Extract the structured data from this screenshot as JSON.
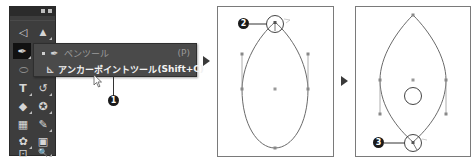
{
  "toolbar": {
    "tools": [
      {
        "name": "direct-selection-tool",
        "glyph": "◁"
      },
      {
        "name": "selection-tool",
        "glyph": "▲"
      },
      {
        "name": "pen-tool",
        "glyph": "✒",
        "active": true
      },
      {
        "name": "curvature-tool",
        "glyph": "·"
      },
      {
        "name": "ellipse-tool",
        "glyph": "⬭"
      },
      {
        "name": "type-tool",
        "glyph": "T"
      },
      {
        "name": "rotate-tool",
        "glyph": "↺"
      },
      {
        "name": "eraser-tool",
        "glyph": "◆"
      },
      {
        "name": "shape-builder-tool",
        "glyph": "✪"
      },
      {
        "name": "gradient-tool",
        "glyph": "▦"
      },
      {
        "name": "eyedropper-tool",
        "glyph": "✎"
      },
      {
        "name": "symbol-sprayer-tool",
        "glyph": "✿"
      },
      {
        "name": "live-paint-tool",
        "glyph": "▣"
      },
      {
        "name": "artboard-tool",
        "glyph": "⊡"
      },
      {
        "name": "zoom-tool",
        "glyph": "🔍"
      }
    ]
  },
  "flyout": {
    "items": [
      {
        "label": "ペンツール",
        "shortcut": "(P)",
        "icon": "pen-icon",
        "glyph": "✒",
        "selected": true
      },
      {
        "label": "アンカーポイントツール",
        "shortcut": "(Shift+C)",
        "icon": "anchor-point-icon",
        "glyph": "⊾",
        "highlighted": true
      }
    ]
  },
  "callouts": [
    {
      "number": "❶",
      "label": "1"
    },
    {
      "number": "❷",
      "label": "2"
    },
    {
      "number": "❸",
      "label": "3"
    }
  ],
  "steps": {
    "arrow1": "▶",
    "arrow2": "▶"
  }
}
